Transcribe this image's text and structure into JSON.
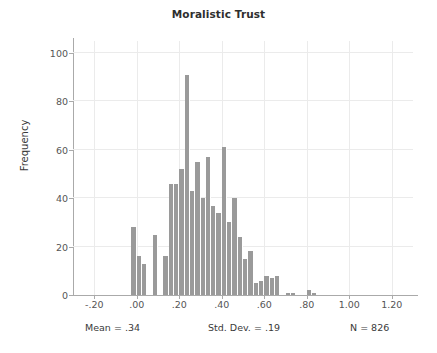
{
  "chart_data": {
    "type": "bar",
    "title": "Moralistic Trust",
    "xlabel": "",
    "ylabel": "Frequency",
    "xlim": [
      -0.3,
      1.3
    ],
    "ylim": [
      0,
      105
    ],
    "grid": true,
    "legend": null,
    "bin_width": 0.025,
    "bar_color": "#9a9a9a",
    "x_tick_labels": [
      "-.20",
      ".00",
      ".20",
      ".40",
      ".60",
      ".80",
      "1.00",
      "1.20"
    ],
    "x_tick_values": [
      -0.2,
      0.0,
      0.2,
      0.4,
      0.6,
      0.8,
      1.0,
      1.2
    ],
    "y_tick_labels": [
      "0",
      "20",
      "40",
      "60",
      "80",
      "100"
    ],
    "y_tick_values": [
      0,
      20,
      40,
      60,
      80,
      100
    ],
    "bin_starts": [
      -0.025,
      0.0,
      0.025,
      0.05,
      0.075,
      0.1,
      0.125,
      0.15,
      0.175,
      0.2,
      0.225,
      0.25,
      0.275,
      0.3,
      0.325,
      0.35,
      0.375,
      0.4,
      0.425,
      0.45,
      0.475,
      0.5,
      0.525,
      0.55,
      0.575,
      0.6,
      0.625,
      0.65,
      0.675,
      0.7,
      0.725,
      0.75,
      0.775,
      0.8,
      0.825,
      0.85,
      0.875,
      0.9,
      0.925,
      0.95,
      0.975
    ],
    "values": [
      28,
      16,
      13,
      0,
      25,
      0,
      16,
      46,
      46,
      52,
      91,
      43,
      55,
      40,
      57,
      37,
      34,
      61,
      30,
      40,
      24,
      15,
      18,
      5,
      6,
      8,
      7,
      8,
      1,
      1,
      0,
      0,
      2,
      1
    ],
    "bars": [
      {
        "x": -0.025,
        "value": 28
      },
      {
        "x": 0.0,
        "value": 16
      },
      {
        "x": 0.025,
        "value": 13
      },
      {
        "x": 0.075,
        "value": 25
      },
      {
        "x": 0.125,
        "value": 16
      },
      {
        "x": 0.15,
        "value": 46
      },
      {
        "x": 0.175,
        "value": 46
      },
      {
        "x": 0.2,
        "value": 52
      },
      {
        "x": 0.225,
        "value": 91
      },
      {
        "x": 0.25,
        "value": 43
      },
      {
        "x": 0.275,
        "value": 55
      },
      {
        "x": 0.3,
        "value": 40
      },
      {
        "x": 0.325,
        "value": 57
      },
      {
        "x": 0.35,
        "value": 37
      },
      {
        "x": 0.375,
        "value": 34
      },
      {
        "x": 0.4,
        "value": 61
      },
      {
        "x": 0.425,
        "value": 30
      },
      {
        "x": 0.45,
        "value": 40
      },
      {
        "x": 0.475,
        "value": 24
      },
      {
        "x": 0.5,
        "value": 15
      },
      {
        "x": 0.525,
        "value": 18
      },
      {
        "x": 0.55,
        "value": 5
      },
      {
        "x": 0.575,
        "value": 6
      },
      {
        "x": 0.6,
        "value": 8
      },
      {
        "x": 0.625,
        "value": 7
      },
      {
        "x": 0.65,
        "value": 8
      },
      {
        "x": 0.7,
        "value": 1
      },
      {
        "x": 0.725,
        "value": 1
      },
      {
        "x": 0.8,
        "value": 2
      },
      {
        "x": 0.825,
        "value": 1
      }
    ],
    "annotations": {
      "mean": "Mean = .34",
      "std_dev": "Std. Dev. = .19",
      "n": "N = 826"
    }
  }
}
